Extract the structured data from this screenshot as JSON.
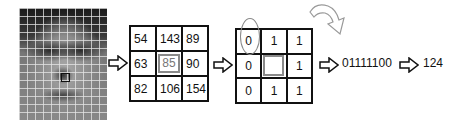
{
  "face_image": {
    "alt": "grayscale face image divided into a grid of cells",
    "highlight": "selected 3x3 region near nose"
  },
  "pixel_matrix": {
    "rows": [
      [
        "54",
        "143",
        "89"
      ],
      [
        "63",
        "85",
        "90"
      ],
      [
        "82",
        "106",
        "154"
      ]
    ],
    "center_value": "85"
  },
  "binary_matrix": {
    "rows": [
      [
        "0",
        "1",
        "1"
      ],
      [
        "0",
        "",
        "1"
      ],
      [
        "0",
        "1",
        "1"
      ]
    ],
    "start_marker": "circled top-left 0",
    "direction_icon": "clockwise-curved-arrow"
  },
  "binary_code": "01111100",
  "decimal_value": "124",
  "icons": {
    "step_arrow": "hollow-right-arrow",
    "rotation_arrow": "curved-arrow"
  },
  "colors": {
    "line": "#111111",
    "highlight": "#8a8a8a",
    "center_text": "#777777"
  }
}
